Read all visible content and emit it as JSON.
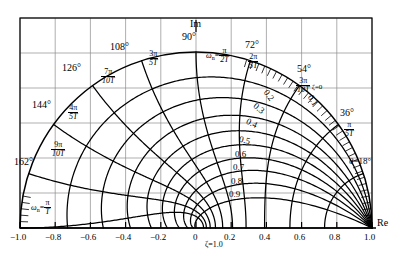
{
  "chart_data": {
    "type": "scatter",
    "xlabel": "Re",
    "ylabel": "Im",
    "xlim": [
      -1.0,
      1.0
    ],
    "ylim": [
      0.0,
      1.2
    ],
    "grid": true,
    "legend_position": "none",
    "x_ticks": [
      "-1.0",
      "-0.8",
      "-0.6",
      "-0.4",
      "-0.2",
      "0",
      "0.2",
      "0.4",
      "0.6",
      "0.8",
      "1.0"
    ],
    "x_tick_values": [
      -1.0,
      -0.8,
      -0.6,
      -0.4,
      -0.2,
      0,
      0.2,
      0.4,
      0.6,
      0.8,
      1.0
    ],
    "unit_circle_radius": 1.0,
    "damping_ratio_curves": {
      "name": "constant zeta (log spiral) loci",
      "values": [
        0,
        0.1,
        0.2,
        0.3,
        0.4,
        0.5,
        0.6,
        0.7,
        0.8,
        0.9,
        1.0
      ],
      "labels": [
        "0.1",
        "0.2",
        "0.3",
        "0.4",
        "0.5",
        "0.6",
        "0.7",
        "0.8",
        "0.9"
      ],
      "zeta_zero_label": "ζ=0",
      "zeta_one_label": "ζ=1.0"
    },
    "natural_frequency_rays": {
      "name": "constant omega-n radial loci",
      "angles_deg": [
        18,
        36,
        54,
        72,
        90,
        108,
        126,
        144,
        162,
        180
      ],
      "entries": [
        {
          "angle": "18°",
          "num": "",
          "den": "",
          "plain": "θ=18°"
        },
        {
          "angle": "36°",
          "num": "π",
          "den": "5T"
        },
        {
          "angle": "54°",
          "num": "3π",
          "den": "10T"
        },
        {
          "angle": "72°",
          "num": "2π",
          "den": "5T"
        },
        {
          "angle": "90°",
          "num": "π",
          "den": "2T"
        },
        {
          "angle": "108°",
          "num": "3π",
          "den": "5T"
        },
        {
          "angle": "126°",
          "num": "7π",
          "den": "10T"
        },
        {
          "angle": "144°",
          "num": "4π",
          "den": "5T"
        },
        {
          "angle": "162°",
          "num": "9π",
          "den": "10T"
        },
        {
          "angle": "180°",
          "num": "π",
          "den": "T"
        }
      ]
    }
  },
  "axes": {
    "im_label": "Im",
    "re_label": "Re",
    "angle_90": "90°",
    "angle_72": "72°",
    "angle_54": "54°",
    "angle_36": "36°",
    "angle_108": "108°",
    "angle_126": "126°",
    "angle_144": "144°",
    "angle_162": "162°",
    "theta_18": "θ=18°"
  },
  "omega_labels": {
    "wn_90_prefix": "ω",
    "wn_90_sub": "n",
    "wn_90_eq": "=",
    "wn_90_num": "π",
    "wn_90_den": "2T",
    "wn_180_num": "π",
    "wn_180_den": "T"
  },
  "fractions": {
    "f_36": {
      "num": "π",
      "den": "5T"
    },
    "f_54": {
      "num": "3π",
      "den": "10T"
    },
    "f_72": {
      "num": "2π",
      "den": "5T"
    },
    "f_108": {
      "num": "3π",
      "den": "5T"
    },
    "f_126": {
      "num": "7π",
      "den": "10T"
    },
    "f_144": {
      "num": "4π",
      "den": "5T"
    },
    "f_162": {
      "num": "9π",
      "den": "10T"
    }
  },
  "zeta": {
    "z0": "ζ=0",
    "z01": "0.1",
    "z02": "0.2",
    "z03": "0.3",
    "z04": "0.4",
    "z05": "0.5",
    "z06": "0.6",
    "z07": "0.7",
    "z08": "0.8",
    "z09": "0.9",
    "z10": "ζ=1.0"
  },
  "ticks": {
    "t_m10": "−1.0",
    "t_m08": "−0.8",
    "t_m06": "−0.6",
    "t_m04": "−0.4",
    "t_m02": "−0.2",
    "t_0": "0",
    "t_02": "0.2",
    "t_04": "0.4",
    "t_06": "0.6",
    "t_08": "0.8",
    "t_10": "1.0"
  },
  "colors": {
    "curve": "#000000",
    "grid": "#8d8d8d",
    "frame": "#000000",
    "background": "#ffffff"
  }
}
